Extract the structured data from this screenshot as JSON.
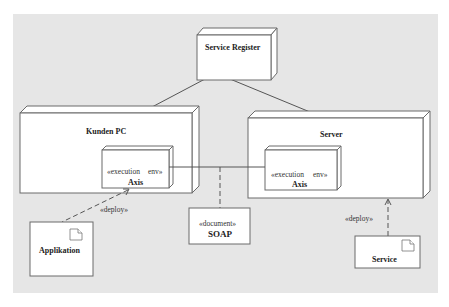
{
  "diagram": {
    "type": "UML deployment diagram",
    "colors": {
      "background": "#e6e6e6",
      "node_fill": "#ffffff",
      "stroke": "#6a6a6a"
    },
    "nodes": {
      "service_register": {
        "label": "Service Register"
      },
      "kunden_pc": {
        "label": "Kunden PC",
        "execution_env": {
          "stereotype_left": "«execution",
          "stereotype_right": "env»",
          "name": "Axis"
        }
      },
      "server": {
        "label": "Server",
        "execution_env": {
          "stereotype_left": "«execution",
          "stereotype_right": "env»",
          "name": "Axis"
        }
      }
    },
    "artifacts": {
      "applikation": {
        "label": "Applikation",
        "icon": "document-icon"
      },
      "soap": {
        "stereotype": "«document»",
        "label": "SOAP"
      },
      "service": {
        "label": "Service",
        "icon": "document-icon"
      }
    },
    "connections": {
      "deploy_left": {
        "label": "«deploy»"
      },
      "deploy_right": {
        "label": "«deploy»"
      }
    }
  }
}
